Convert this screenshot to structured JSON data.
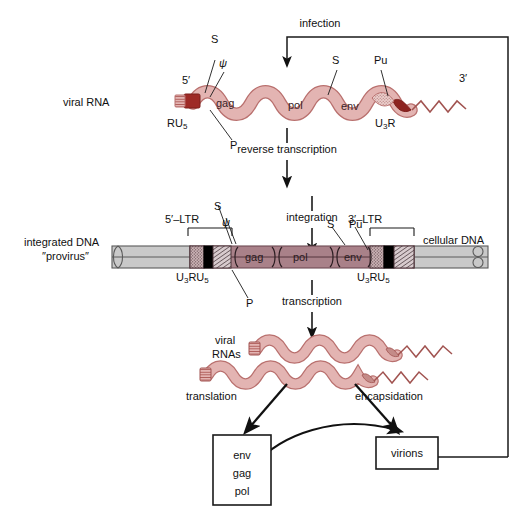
{
  "figure": {
    "type": "biology-process-diagram"
  },
  "colors": {
    "rna_fill": "#e3b4b2",
    "rna_stroke": "#b9706e",
    "rna_cap": "#9e2a26",
    "dna_provirus_fill": "#a98189",
    "dna_provirus_stroke": "#6d4a52",
    "cellular_dna_fill": "#c9c9c9",
    "cellular_dna_stroke": "#5a5a5a",
    "ltr_r_block": "#000000",
    "line": "#1a1a1a"
  },
  "process_labels": {
    "infection": "infection",
    "reverse_transcription": "reverse transcription",
    "integration": "integration",
    "transcription": "transcription",
    "translation": "translation",
    "encapsidation": "encapsidation"
  },
  "viral_rna": {
    "row_label": "viral RNA",
    "five_prime": "5′",
    "three_prime": "3′",
    "cap_label": "RU",
    "cap_label_sub": "5",
    "tail_label": "U",
    "tail_label_sub": "3",
    "tail_label_rest": "R",
    "genes": [
      "gag",
      "pol",
      "env"
    ],
    "sites": [
      {
        "name": "S",
        "position": "left"
      },
      {
        "name": "ψ",
        "position": "left"
      },
      {
        "name": "P",
        "position": "below-left"
      },
      {
        "name": "S",
        "position": "mid-right"
      },
      {
        "name": "Pu",
        "position": "right"
      }
    ]
  },
  "provirus": {
    "row_label_line1": "integrated DNA",
    "row_label_line2": "″provirus″",
    "cellular_dna_label": "cellular DNA",
    "ltr_left_label": "5′–LTR",
    "ltr_right_label": "3′–LTR",
    "ltr_segments_label_u": "U",
    "ltr_segments_label_u_sub": "3",
    "ltr_segments_label_r": "R",
    "ltr_segments_label_u5": "U",
    "ltr_segments_label_u5_sub": "5",
    "genes": [
      "gag",
      "pol",
      "env"
    ],
    "sites": [
      {
        "name": "S",
        "position": "left"
      },
      {
        "name": "ψ",
        "position": "left"
      },
      {
        "name": "P",
        "position": "below-left"
      },
      {
        "name": "S",
        "position": "mid-right"
      },
      {
        "name": "Pu",
        "position": "right"
      }
    ]
  },
  "viral_rnas": {
    "label_line1": "viral",
    "label_line2": "RNAs",
    "count": 2
  },
  "products_box": {
    "items": [
      "env",
      "gag",
      "pol"
    ]
  },
  "virions_box": {
    "label": "virions"
  }
}
